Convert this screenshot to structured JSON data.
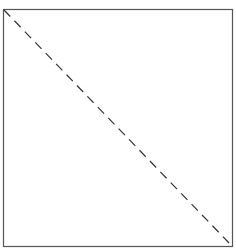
{
  "diagram": {
    "shape": "square",
    "box": {
      "x": 3.5,
      "y": 9.5,
      "width": 229,
      "height": 237
    },
    "diagonal": {
      "x1": 4,
      "y1": 10,
      "x2": 232,
      "y2": 246,
      "style": "dashed"
    },
    "colors": {
      "background": "#ffffff",
      "border": "#555555",
      "diagonal": "#333333"
    }
  }
}
